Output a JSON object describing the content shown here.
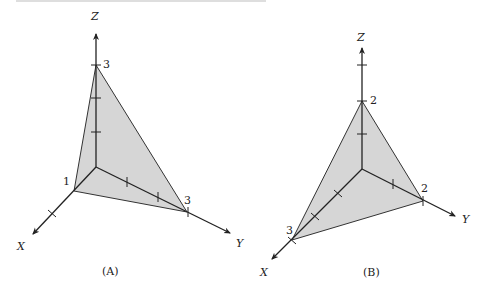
{
  "figure": {
    "background": "#ffffff",
    "fill_color": "#d6d6d6",
    "line_color": "#222222",
    "panels": [
      {
        "id": "A",
        "caption": "(A)",
        "axis_labels": {
          "x": "X",
          "y": "Y",
          "z": "Z"
        },
        "intercepts": {
          "x": "1",
          "y": "3",
          "z": "3"
        }
      },
      {
        "id": "B",
        "caption": "(B)",
        "axis_labels": {
          "x": "X",
          "y": "Y",
          "z": "Z"
        },
        "intercepts": {
          "x": "3",
          "y": "2",
          "z": "2"
        }
      }
    ]
  }
}
